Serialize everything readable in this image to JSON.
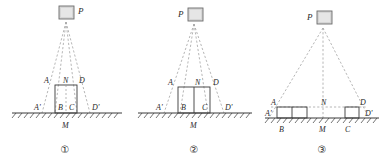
{
  "figure": {
    "colors": {
      "line": "#3a3a3a",
      "dashed_ray": "#9a9a9a",
      "ground": "#3a3a3a",
      "lamp_fill": "#d6d6d6",
      "lamp_stroke": "#6b6b6b",
      "text": "#2a2a2a"
    }
  },
  "panels": [
    {
      "id": "panel-1",
      "caption": "①",
      "source_label": "P",
      "source_label_side": "right",
      "ground_label": "M",
      "box_top_labels": [
        "A",
        "N",
        "D"
      ],
      "box_base_labels": [
        "A'",
        "B",
        "C",
        "D'"
      ],
      "box_count": 1,
      "box_divider": "dashed-center",
      "description": "Single tall narrow block centered under source P; shadow edges A'–D' on ground"
    },
    {
      "id": "panel-2",
      "caption": "②",
      "source_label": "P",
      "source_label_side": "left",
      "ground_label": "M",
      "box_top_labels": [
        "A",
        "N",
        "D"
      ],
      "box_base_labels": [
        "A'",
        "B",
        "C",
        "D'"
      ],
      "box_count": 2,
      "box_divider": "solid-center",
      "description": "Wider block of two equal halves centered under source P; shadow edges A'–D'"
    },
    {
      "id": "panel-3",
      "caption": "③",
      "source_label": "P",
      "source_label_side": "left",
      "ground_label": "M",
      "box_top_labels": [
        "A",
        "N",
        "D"
      ],
      "box_base_labels": [
        "A'",
        "B",
        "C",
        "D'"
      ],
      "box_count": 3,
      "box_divider": "split-pair-and-single",
      "description": "Two short blocks separated far apart on the ground under source P; shadow edges A'–D'"
    }
  ]
}
